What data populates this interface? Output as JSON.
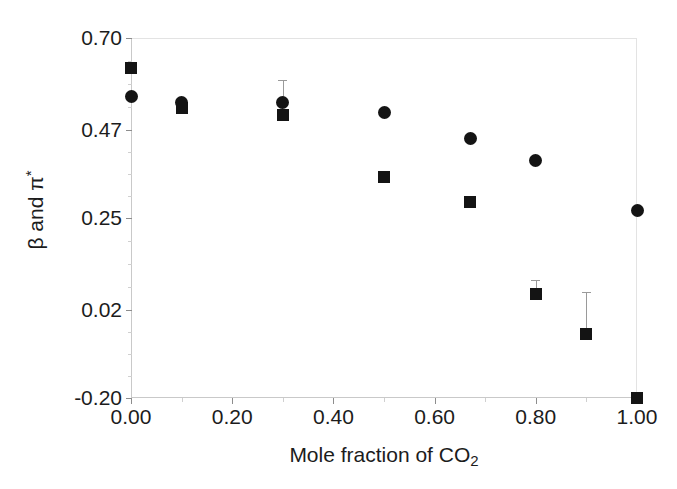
{
  "chart_data": {
    "type": "scatter",
    "title": "",
    "xlabel": "Mole fraction of CO2",
    "xlabel_parts": {
      "text": "Mole fraction of CO",
      "sub": "2"
    },
    "ylabel": "β and π*",
    "ylabel_parts": {
      "text": "β and π",
      "sup": "*"
    },
    "xlim": [
      0.0,
      1.0
    ],
    "ylim": [
      -0.2,
      0.7
    ],
    "xticks": [
      0.0,
      0.2,
      0.4,
      0.6,
      0.8,
      1.0
    ],
    "xticklabels": [
      "0.00",
      "0.20",
      "0.40",
      "0.60",
      "0.80",
      "1.00"
    ],
    "yticks": [
      -0.2,
      0.02,
      0.25,
      0.47,
      0.7
    ],
    "yticklabels": [
      "-0.20",
      "0.02",
      "0.25",
      "0.47",
      "0.70"
    ],
    "grid": false,
    "legend": "none",
    "marker_color": "#141414",
    "errorbar_color": "#9a9a9a",
    "series": [
      {
        "name": "π*",
        "marker": "circle",
        "points": [
          {
            "x": 0.0,
            "y": 0.553
          },
          {
            "x": 0.1,
            "y": 0.54
          },
          {
            "x": 0.3,
            "y": 0.54,
            "yerr_upper": 0.055
          },
          {
            "x": 0.5,
            "y": 0.515
          },
          {
            "x": 0.67,
            "y": 0.45
          },
          {
            "x": 0.8,
            "y": 0.395
          },
          {
            "x": 1.0,
            "y": 0.27
          }
        ]
      },
      {
        "name": "β",
        "marker": "square",
        "points": [
          {
            "x": 0.0,
            "y": 0.625
          },
          {
            "x": 0.1,
            "y": 0.525
          },
          {
            "x": 0.3,
            "y": 0.508
          },
          {
            "x": 0.5,
            "y": 0.352
          },
          {
            "x": 0.67,
            "y": 0.29
          },
          {
            "x": 0.8,
            "y": 0.06,
            "yerr_upper": 0.035
          },
          {
            "x": 0.9,
            "y": -0.04,
            "yerr_upper": 0.105
          },
          {
            "x": 1.0,
            "y": -0.2
          }
        ]
      }
    ]
  }
}
